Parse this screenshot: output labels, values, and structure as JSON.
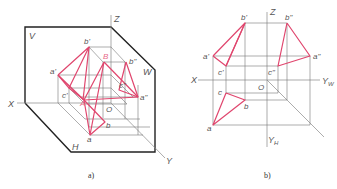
{
  "colors": {
    "projection_lines": "#e0466e",
    "frame": "#222222",
    "construction": "#777777",
    "labels": "#555555"
  },
  "figure_a": {
    "caption": "a)",
    "planes": {
      "v": "V",
      "w": "W",
      "h": "H"
    },
    "axes": {
      "x": "X",
      "y": "Y",
      "z": "Z",
      "origin": "O"
    },
    "points": {
      "b_prime": "b'",
      "B": "B",
      "b_dprime": "b\"",
      "a_prime": "a'",
      "c_prime": "c'",
      "A": "A",
      "a_dprime": "a\"",
      "c_dprime": "c\"",
      "b": "b",
      "a": "a"
    }
  },
  "figure_b": {
    "caption": "b)",
    "axes": {
      "x": "X",
      "z": "Z",
      "origin": "O",
      "yw": "Y",
      "yw_sub": "W",
      "yh": "Y",
      "yh_sub": "H"
    },
    "points": {
      "b_prime": "b'",
      "b_dprime": "b\"",
      "a_prime": "a'",
      "a_dprime": "a\"",
      "c_prime": "c'",
      "c_dprime": "c\"",
      "c": "c",
      "b": "b",
      "a": "a"
    }
  }
}
